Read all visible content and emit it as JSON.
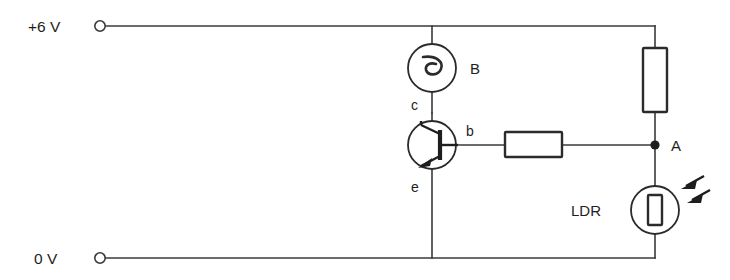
{
  "diagram": {
    "stroke_color": "#2b2b2b",
    "wire_color": "#3a3a3a",
    "background_color": "#ffffff"
  },
  "rails": {
    "positive": {
      "label": "+6 V",
      "terminal": "terminal-circle"
    },
    "ground": {
      "label": "0 V",
      "terminal": "terminal-circle"
    }
  },
  "components": {
    "bell": {
      "label": "B",
      "type": "bell"
    },
    "transistor": {
      "type": "npn-transistor",
      "collector_label": "c",
      "base_label": "b",
      "emitter_label": "e"
    },
    "base_resistor": {
      "type": "resistor",
      "label": ""
    },
    "pullup_resistor": {
      "type": "resistor",
      "label": ""
    },
    "ldr": {
      "type": "light-dependent-resistor",
      "label": "LDR"
    }
  },
  "nodes": {
    "a": {
      "label": "A",
      "type": "junction-dot"
    }
  }
}
